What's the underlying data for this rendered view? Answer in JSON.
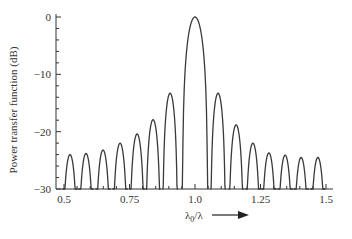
{
  "chart_data": {
    "type": "line",
    "title": "",
    "xlabel": "λ0/λ",
    "xlabel_main": "λ",
    "xlabel_sub": "0",
    "xlabel_tail": "/λ",
    "ylabel": "Power transfer function (dB)",
    "xlim": [
      0.47,
      1.53
    ],
    "ylim": [
      -30,
      0
    ],
    "x_ticks": [
      0.5,
      0.75,
      1.0,
      1.25,
      1.5
    ],
    "x_tick_labels": [
      "0.5",
      "0.75",
      "1.0",
      "1.25",
      "1.5"
    ],
    "y_ticks": [
      0,
      -10,
      -20,
      -30
    ],
    "y_tick_labels": [
      "0",
      "−10",
      "−20",
      "−30"
    ],
    "grid": false,
    "legend": null,
    "annotations": [
      "arrow pointing right after x-axis label"
    ],
    "series": [
      {
        "name": "Power transfer function",
        "description": "sinc²-like response: main lobe at λ0/λ = 1.0 plus sidelobes (peak positions and levels)",
        "main_lobe": {
          "x": 1.0,
          "y": 0,
          "null_left": 0.955,
          "null_right": 1.052
        },
        "sidelobes_left": [
          {
            "x": 0.523,
            "y": -24.0
          },
          {
            "x": 0.584,
            "y": -23.8
          },
          {
            "x": 0.649,
            "y": -23.2
          },
          {
            "x": 0.714,
            "y": -22.0
          },
          {
            "x": 0.779,
            "y": -20.4
          },
          {
            "x": 0.84,
            "y": -17.9
          },
          {
            "x": 0.905,
            "y": -13.3
          }
        ],
        "sidelobes_right": [
          {
            "x": 1.088,
            "y": -13.3
          },
          {
            "x": 1.157,
            "y": -18.8
          },
          {
            "x": 1.221,
            "y": -22.0
          },
          {
            "x": 1.282,
            "y": -23.7
          },
          {
            "x": 1.344,
            "y": -24.1
          },
          {
            "x": 1.405,
            "y": -24.5
          },
          {
            "x": 1.469,
            "y": -24.5
          }
        ]
      }
    ]
  },
  "style": {
    "line_color": "#3a3a3a",
    "axis_color": "#333333"
  }
}
